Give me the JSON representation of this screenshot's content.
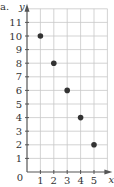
{
  "part_label": "a.",
  "chart_data": {
    "type": "scatter",
    "title": "",
    "xlabel": "x",
    "ylabel": "y",
    "x": [
      1,
      2,
      3,
      4,
      5
    ],
    "y": [
      10,
      8,
      6,
      4,
      2
    ],
    "xlim": [
      0,
      6
    ],
    "ylim": [
      0,
      12
    ],
    "xticks": [
      1,
      2,
      3,
      4,
      5
    ],
    "yticks": [
      1,
      2,
      3,
      4,
      5,
      6,
      7,
      8,
      9,
      10,
      11
    ],
    "origin_label": "0",
    "grid": true,
    "legend": null
  },
  "colors": {
    "grid": "#c8c8c8",
    "axis": "#555555",
    "point": "#333333"
  }
}
